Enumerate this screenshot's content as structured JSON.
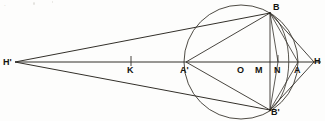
{
  "figure": {
    "background_color": "#fdfdfc",
    "ink_color": "#26241f",
    "axis": {
      "label": "horizontal-axis-H-prime-to-H",
      "y": 62,
      "x_start": 15,
      "x_end": 320
    },
    "circle": {
      "center_x": 241,
      "center_y": 62,
      "radius": 57,
      "label": "main-circle"
    },
    "points": [
      {
        "id": "Hp",
        "label": "H'",
        "x": 15,
        "y": 62,
        "label_x": 3,
        "label_y": 58,
        "tick": false
      },
      {
        "id": "K",
        "label": "K",
        "x": 131,
        "y": 62,
        "label_x": 127,
        "label_y": 66,
        "tick": true
      },
      {
        "id": "Ap",
        "label": "A'",
        "x": 186,
        "y": 62,
        "label_x": 180,
        "label_y": 66,
        "tick": false
      },
      {
        "id": "O",
        "label": "O",
        "x": 241,
        "y": 62,
        "label_x": 237,
        "label_y": 66,
        "tick": false
      },
      {
        "id": "M",
        "label": "M",
        "x": 258,
        "y": 62,
        "label_x": 256,
        "label_y": 66,
        "tick": false
      },
      {
        "id": "N",
        "label": "N",
        "x": 278,
        "y": 62,
        "label_x": 275,
        "label_y": 66,
        "tick": true
      },
      {
        "id": "A",
        "label": "A",
        "x": 298,
        "y": 62,
        "label_x": 295,
        "label_y": 66,
        "tick": false
      },
      {
        "id": "H",
        "label": "H",
        "x": 313,
        "y": 62,
        "label_x": 314,
        "label_y": 57,
        "tick": false
      },
      {
        "id": "B",
        "label": "B",
        "x": 270,
        "y": 13,
        "label_x": 273,
        "label_y": 3,
        "tick": false
      },
      {
        "id": "Bp",
        "label": "B'",
        "x": 270,
        "y": 110,
        "label_x": 271,
        "label_y": 108,
        "tick": false
      }
    ],
    "segments": [
      {
        "name": "axis-Hprime-to-H",
        "x1": 15,
        "y1": 62,
        "x2": 320,
        "y2": 62
      },
      {
        "name": "chord-Hprime-to-B",
        "x1": 15,
        "y1": 62,
        "x2": 270,
        "y2": 13
      },
      {
        "name": "chord-Hprime-to-Bprime",
        "x1": 15,
        "y1": 62,
        "x2": 270,
        "y2": 110
      },
      {
        "name": "chord-Aprime-to-B",
        "x1": 186,
        "y1": 62,
        "x2": 270,
        "y2": 13
      },
      {
        "name": "chord-Aprime-to-Bprime",
        "x1": 186,
        "y1": 62,
        "x2": 270,
        "y2": 110
      },
      {
        "name": "chord-B-to-Bprime-vertical",
        "x1": 270,
        "y1": 13,
        "x2": 270,
        "y2": 110
      },
      {
        "name": "chord-B-to-A",
        "x1": 270,
        "y1": 13,
        "x2": 298,
        "y2": 62
      },
      {
        "name": "chord-A-to-Bprime",
        "x1": 298,
        "y1": 62,
        "x2": 270,
        "y2": 110
      },
      {
        "name": "tangent-B-to-H",
        "x1": 270,
        "y1": 13,
        "x2": 313,
        "y2": 62
      },
      {
        "name": "tangent-H-to-Bprime",
        "x1": 313,
        "y1": 62,
        "x2": 270,
        "y2": 110
      },
      {
        "name": "chord-B-to-N",
        "x1": 270,
        "y1": 13,
        "x2": 278,
        "y2": 62
      },
      {
        "name": "chord-N-to-Bprime",
        "x1": 278,
        "y1": 62,
        "x2": 270,
        "y2": 110
      }
    ],
    "arcs": [
      {
        "name": "arc-B-to-Bprime-right-bulge",
        "d": "M 270 13 C 296 30 296 93 270 110"
      }
    ],
    "ticks": [
      {
        "name": "tick-K",
        "x": 131,
        "y_top": 56,
        "y_bottom": 66
      },
      {
        "name": "tick-N",
        "x": 278,
        "y_top": 56,
        "y_bottom": 62
      }
    ],
    "artifacts": {
      "top_left_smudge": "."
    }
  }
}
